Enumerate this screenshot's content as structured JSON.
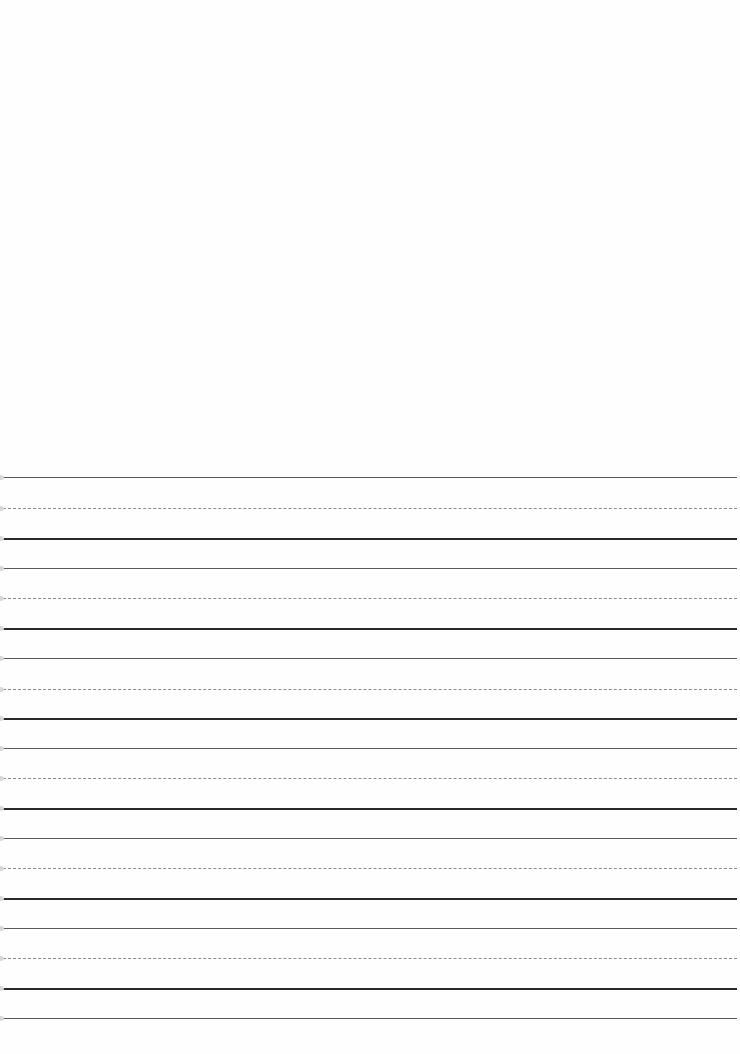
{
  "document": {
    "type": "handwriting practice paper",
    "top_blank_area": true,
    "line_groups": [
      {
        "top": 477,
        "mid": 508,
        "base": 538
      },
      {
        "top": 568,
        "mid": 598,
        "base": 628
      },
      {
        "top": 658,
        "mid": 689,
        "base": 718
      },
      {
        "top": 748,
        "mid": 778,
        "base": 808
      },
      {
        "top": 838,
        "mid": 868,
        "base": 898
      },
      {
        "top": 928,
        "mid": 958,
        "base": 988
      }
    ],
    "final_line": 1018,
    "colors": {
      "thin_line": "#5a5a5a",
      "dashed_line": "#8a8a8a",
      "thick_line": "#2a2a2a",
      "background": "#fefefe"
    }
  }
}
